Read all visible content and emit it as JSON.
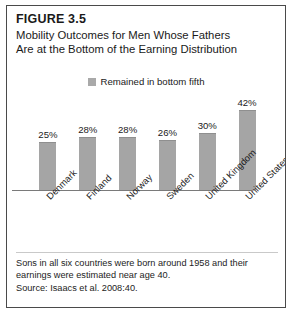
{
  "figure": {
    "number": "FIGURE 3.5",
    "title_line1": "Mobility Outcomes for Men Whose Fathers",
    "title_line2": "Are at the Bottom of the Earning Distribution",
    "note_line1": "Sons in all six countries were born around 1958 and their",
    "note_line2": "earnings were estimated near age 40.",
    "note_line3": "Source: Isaacs et al. 2008:40."
  },
  "chart_data": {
    "type": "bar",
    "title": "Mobility Outcomes for Men Whose Fathers Are at the Bottom of the Earning Distribution",
    "xlabel": "",
    "ylabel": "",
    "ylim": [
      0,
      50
    ],
    "grid": false,
    "legend_position": "top-center",
    "categories": [
      "Denmark",
      "Finland",
      "Norway",
      "Sweden",
      "United Kingdom",
      "United States"
    ],
    "series": [
      {
        "name": "Remained in bottom fifth",
        "color": "#a5a5a5",
        "values": [
          25,
          28,
          28,
          26,
          30,
          42
        ],
        "labels": [
          "25%",
          "28%",
          "28%",
          "26%",
          "30%",
          "42%"
        ]
      }
    ]
  },
  "colors": {
    "bar": "#a5a5a5",
    "frame": "#4a4a4a",
    "axis": "#7a7a7a",
    "text": "#1a1a1a"
  }
}
